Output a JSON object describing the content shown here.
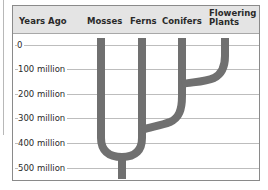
{
  "header": {
    "y_axis_title": "Years Ago",
    "columns": [
      {
        "label": "Mosses",
        "x": 101
      },
      {
        "label": "Ferns",
        "x": 142
      },
      {
        "label": "Conifers",
        "x": 182
      },
      {
        "label": "Flowering Plants",
        "line1": "Flowering",
        "line2": "Plants",
        "x": 225
      }
    ]
  },
  "time_axis": {
    "labels": [
      "0",
      "100 million",
      "200 million",
      "300 million",
      "400 million",
      "500 million"
    ],
    "y_positions": [
      44,
      68,
      93,
      117,
      142,
      167
    ]
  },
  "tree": {
    "color": "#707070",
    "branches": [
      {
        "from": "root",
        "to": "Mosses/Ferns split",
        "time": "~440 million years ago"
      },
      {
        "from": "Ferns lineage",
        "to": "Conifers",
        "time": "~350 million years ago"
      },
      {
        "from": "Conifers lineage",
        "to": "Flowering Plants",
        "time": "~150 million years ago"
      }
    ]
  },
  "colors": {
    "header_bg": "#e4e4e4",
    "gridline": "#bdbdbd",
    "frame": "#8a8a8a",
    "branch": "#707070"
  }
}
